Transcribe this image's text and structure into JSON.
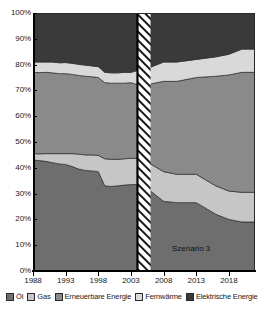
{
  "chart_data": {
    "type": "area",
    "stacked": true,
    "title": "",
    "xlabel": "",
    "ylabel": "",
    "ylim": [
      0,
      100
    ],
    "xlim": [
      1988,
      2022
    ],
    "yticks": [
      "0%",
      "10%",
      "20%",
      "30%",
      "40%",
      "50%",
      "60%",
      "70%",
      "80%",
      "90%",
      "100%"
    ],
    "ytick_values": [
      0,
      10,
      20,
      30,
      40,
      50,
      60,
      70,
      80,
      90,
      100
    ],
    "xticks": [
      "1988",
      "1993",
      "1998",
      "2003",
      "2008",
      "2013",
      "2018"
    ],
    "xtick_values": [
      1988,
      1993,
      1998,
      2003,
      2008,
      2013,
      2018
    ],
    "grid": false,
    "legend_position": "bottom",
    "annotations": [
      {
        "text": "Szenario 3",
        "x": 2014,
        "y": 10
      }
    ],
    "forecast_start": 2004,
    "hatch_band": [
      2004,
      2006
    ],
    "x": [
      1988,
      1989,
      1990,
      1991,
      1992,
      1993,
      1994,
      1995,
      1996,
      1997,
      1998,
      1999,
      2000,
      2001,
      2002,
      2003,
      2004,
      2006,
      2008,
      2010,
      2013,
      2016,
      2018,
      2020,
      2022
    ],
    "series": [
      {
        "name": "Öl",
        "color": "#6e6e6e",
        "values": [
          43.0,
          42.8,
          42.5,
          42.0,
          41.5,
          41.3,
          40.5,
          39.5,
          39.0,
          38.8,
          38.5,
          33.0,
          32.8,
          33.0,
          33.3,
          33.5,
          33.5,
          31.0,
          27.0,
          26.5,
          26.5,
          22.0,
          20.0,
          19.0,
          19.0
        ]
      },
      {
        "name": "Gas",
        "color": "#c6c6c6",
        "values": [
          2.5,
          2.6,
          3.0,
          3.5,
          4.0,
          4.2,
          5.0,
          5.8,
          6.0,
          6.2,
          6.3,
          10.5,
          10.5,
          10.3,
          10.2,
          10.2,
          10.2,
          10.5,
          11.5,
          11.0,
          11.0,
          11.0,
          11.0,
          11.5,
          11.5
        ]
      },
      {
        "name": "Erneuerbare Energie",
        "color": "#8a8a8a",
        "values": [
          31.5,
          31.5,
          31.5,
          31.3,
          31.0,
          31.0,
          30.7,
          30.5,
          30.5,
          30.3,
          30.2,
          29.5,
          29.5,
          29.5,
          29.3,
          29.3,
          28.5,
          31.0,
          35.0,
          36.0,
          37.5,
          42.5,
          45.0,
          46.5,
          46.5
        ]
      },
      {
        "name": "Fernwärme",
        "color": "#d9d9d9",
        "values": [
          4.0,
          4.1,
          4.0,
          4.2,
          4.2,
          4.3,
          4.3,
          4.3,
          4.3,
          4.2,
          4.2,
          4.0,
          4.0,
          4.0,
          4.2,
          4.0,
          5.5,
          6.5,
          7.5,
          7.5,
          7.0,
          7.5,
          8.0,
          9.0,
          9.0
        ]
      },
      {
        "name": "Elektrische Energie",
        "color": "#3a3a3a",
        "values": [
          19.0,
          19.0,
          19.0,
          19.0,
          19.3,
          19.2,
          19.5,
          19.9,
          20.2,
          20.5,
          20.8,
          23.0,
          23.2,
          23.2,
          23.0,
          23.0,
          22.3,
          21.0,
          19.0,
          19.0,
          18.0,
          17.0,
          16.0,
          14.0,
          14.0
        ]
      }
    ]
  },
  "legend": {
    "items": [
      {
        "label": "Öl",
        "color": "#6e6e6e"
      },
      {
        "label": "Gas",
        "color": "#c6c6c6"
      },
      {
        "label": "Erneuerbare Energie",
        "color": "#8a8a8a"
      },
      {
        "label": "Fernwärme",
        "color": "#d9d9d9"
      },
      {
        "label": "Elektrische Energie",
        "color": "#3a3a3a"
      }
    ]
  },
  "annotation": {
    "scenario": "Szenario 3"
  }
}
